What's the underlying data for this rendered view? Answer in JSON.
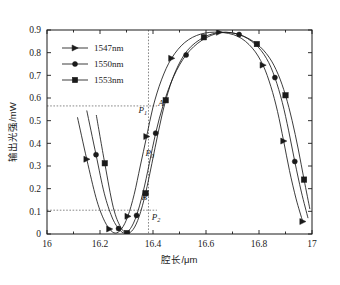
{
  "chart_data": {
    "type": "line",
    "title": "",
    "xlabel": "腔长/μm",
    "ylabel": "输出光强/mW",
    "xlim": [
      16,
      17
    ],
    "ylim": [
      0,
      0.9
    ],
    "xticks": [
      "16",
      "16.2",
      "16.4",
      "16.6",
      "16.8",
      "17"
    ],
    "xtick_values": [
      16,
      16.2,
      16.4,
      16.6,
      16.8,
      17
    ],
    "yticks": [
      "0",
      "0.1",
      "0.2",
      "0.3",
      "0.4",
      "0.5",
      "0.6",
      "0.7",
      "0.8",
      "0.9"
    ],
    "ytick_values": [
      0,
      0.1,
      0.2,
      0.3,
      0.4,
      0.5,
      0.6,
      0.7,
      0.8,
      0.9
    ],
    "grid": false,
    "legend_position": "upper-left",
    "series": [
      {
        "name": "1547nm",
        "marker": "triangle-right",
        "x": [
          16.115,
          16.15,
          16.185,
          16.212,
          16.236,
          16.258,
          16.281,
          16.305,
          16.329,
          16.352,
          16.376,
          16.4,
          16.432,
          16.47,
          16.52,
          16.58,
          16.65,
          16.72,
          16.775,
          16.815,
          16.845,
          16.87,
          16.893,
          16.915,
          16.94,
          16.965
        ],
        "y": [
          0.515,
          0.33,
          0.16,
          0.07,
          0.022,
          0.004,
          0.022,
          0.078,
          0.175,
          0.3,
          0.43,
          0.56,
          0.68,
          0.775,
          0.845,
          0.882,
          0.89,
          0.872,
          0.82,
          0.745,
          0.65,
          0.54,
          0.41,
          0.28,
          0.155,
          0.055
        ]
      },
      {
        "name": "1550nm",
        "marker": "circle",
        "x": [
          16.15,
          16.185,
          16.216,
          16.245,
          16.27,
          16.292,
          16.315,
          16.338,
          16.362,
          16.386,
          16.41,
          16.44,
          16.478,
          16.525,
          16.585,
          16.655,
          16.725,
          16.785,
          16.828,
          16.86,
          16.888,
          16.912,
          16.935,
          16.96,
          16.985
        ],
        "y": [
          0.545,
          0.35,
          0.18,
          0.075,
          0.024,
          0.004,
          0.024,
          0.082,
          0.182,
          0.31,
          0.445,
          0.575,
          0.695,
          0.79,
          0.855,
          0.888,
          0.88,
          0.838,
          0.775,
          0.69,
          0.58,
          0.455,
          0.32,
          0.185,
          0.07
        ]
      },
      {
        "name": "1553nm",
        "marker": "square",
        "x": [
          16.186,
          16.218,
          16.25,
          16.278,
          16.302,
          16.325,
          16.348,
          16.372,
          16.396,
          16.42,
          16.448,
          16.484,
          16.53,
          16.592,
          16.66,
          16.73,
          16.792,
          16.838,
          16.872,
          16.9,
          16.925,
          16.948,
          16.97,
          16.992
        ],
        "y": [
          0.525,
          0.312,
          0.118,
          0.03,
          0.004,
          0.02,
          0.078,
          0.18,
          0.312,
          0.45,
          0.59,
          0.715,
          0.81,
          0.868,
          0.89,
          0.878,
          0.838,
          0.78,
          0.705,
          0.612,
          0.5,
          0.375,
          0.24,
          0.11
        ]
      }
    ],
    "annotations": [
      {
        "label": "P",
        "sub": "1",
        "x": 16.345,
        "y": 0.535
      },
      {
        "label": "P",
        "sub": "0",
        "x": 16.372,
        "y": 0.345
      },
      {
        "label": "B",
        "sub": "",
        "x": 16.357,
        "y": 0.15
      },
      {
        "label": "P",
        "sub": "2",
        "x": 16.395,
        "y": 0.062
      },
      {
        "label": "A",
        "sub": "",
        "x": 16.42,
        "y": 0.565
      }
    ],
    "guide_lines": [
      {
        "orient": "horizontal",
        "value": 0.565,
        "from": 16.0,
        "to": 16.415
      },
      {
        "orient": "horizontal",
        "value": 0.105,
        "from": 16.0,
        "to": 16.415
      },
      {
        "orient": "vertical",
        "value": 16.383,
        "from": 0.0,
        "to": 0.9
      }
    ]
  },
  "legend": {
    "entries": [
      {
        "label": "1547nm",
        "marker": "triangle-right"
      },
      {
        "label": "1550nm",
        "marker": "circle"
      },
      {
        "label": "1553nm",
        "marker": "square"
      }
    ]
  },
  "axes": {
    "x_title": "腔长/μm",
    "y_title": "输出光强/mW"
  }
}
